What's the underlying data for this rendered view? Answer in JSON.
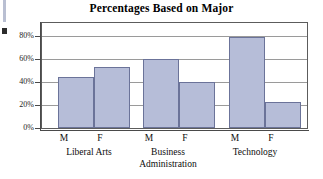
{
  "chart_data": {
    "type": "bar",
    "title": "Percentages Based on Major",
    "xlabel": "",
    "ylabel": "",
    "ylim": [
      0,
      90
    ],
    "ytick_values": [
      0,
      20,
      40,
      60,
      80
    ],
    "ytick_labels": [
      "0%",
      "20%",
      "40%",
      "60%",
      "80%"
    ],
    "grid": true,
    "legend": "none",
    "categories": [
      "Liberal Arts",
      "Business Administration",
      "Technology"
    ],
    "subcategories": [
      "M",
      "F"
    ],
    "bars": [
      {
        "group": "Liberal Arts",
        "sex": "M",
        "value": 44,
        "label": "M"
      },
      {
        "group": "Liberal Arts",
        "sex": "F",
        "value": 53,
        "label": "F"
      },
      {
        "group": "Business Administration",
        "sex": "M",
        "value": 60,
        "label": "M"
      },
      {
        "group": "Business Administration",
        "sex": "F",
        "value": 40,
        "label": "F"
      },
      {
        "group": "Technology",
        "sex": "M",
        "value": 79,
        "label": "M"
      },
      {
        "group": "Technology",
        "sex": "F",
        "value": 23,
        "label": "F"
      }
    ],
    "series": [
      {
        "name": "M",
        "values": [
          44,
          60,
          79
        ]
      },
      {
        "name": "F",
        "values": [
          53,
          40,
          23
        ]
      }
    ],
    "colors": {
      "bar_fill": "#b6bdd8",
      "bar_border": "#6b7399",
      "gridline": "#9a9a9a",
      "axis": "#4a4a4a",
      "text": "#0d0d0d",
      "background": "#ffffff"
    }
  },
  "axis": {
    "y_labels": [
      "80%",
      "60%",
      "40%",
      "20%",
      "0%"
    ]
  },
  "group_labels": {
    "liberal_arts": "Liberal Arts",
    "business_line1": "Business",
    "business_line2": "Administration",
    "technology": "Technology"
  },
  "mf": {
    "m": "M",
    "f": "F"
  }
}
